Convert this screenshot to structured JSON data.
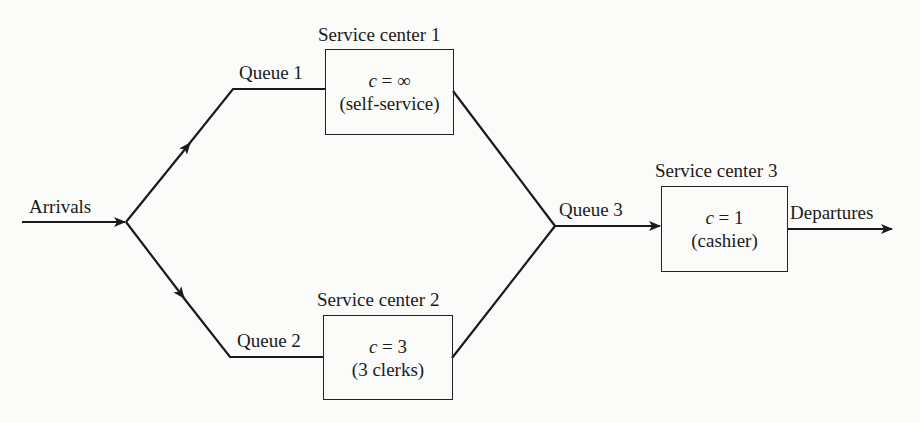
{
  "diagram": {
    "arrivals_label": "Arrivals",
    "departures_label": "Departures",
    "queues": [
      {
        "label": "Queue 1"
      },
      {
        "label": "Queue 2"
      },
      {
        "label": "Queue 3"
      }
    ],
    "service_centers": [
      {
        "title": "Service center 1",
        "capacity_var": "c",
        "capacity_eq": " = ∞",
        "description": "(self-service)"
      },
      {
        "title": "Service center 2",
        "capacity_var": "c",
        "capacity_eq": " = 3",
        "description": "(3 clerks)"
      },
      {
        "title": "Service center 3",
        "capacity_var": "c",
        "capacity_eq": " = 1",
        "description": "(cashier)"
      }
    ],
    "colors": {
      "line": "#1a1a1a",
      "background": "#fbfbfa"
    }
  }
}
